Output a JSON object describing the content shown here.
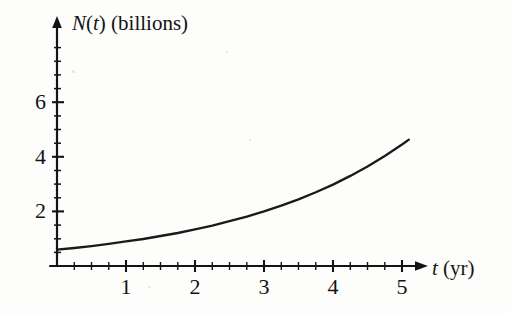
{
  "figure": {
    "background_color": "#fdfdfb",
    "ink_color": "#141414"
  },
  "axes": {
    "y_axis": {
      "label_prefix": "N",
      "label_variable": "(t)",
      "label_suffix": " (billions)",
      "full_label": "N(t) (billions)",
      "tick_labels": [
        "2",
        "4",
        "6"
      ],
      "tick_values": [
        2,
        4,
        6
      ],
      "minor_tick_step": 0.5,
      "has_arrow": true
    },
    "x_axis": {
      "label_variable": "t",
      "label_suffix": " (yr)",
      "full_label": "t (yr)",
      "tick_labels": [
        "1",
        "2",
        "3",
        "4",
        "5"
      ],
      "tick_values": [
        1,
        2,
        3,
        4,
        5
      ],
      "minor_tick_step": 0.25,
      "has_arrow": true
    }
  },
  "chart_data": {
    "type": "line",
    "title": "",
    "xlabel": "t (yr)",
    "ylabel": "N(t) (billions)",
    "xlim": [
      0,
      5.1
    ],
    "ylim": [
      0,
      8
    ],
    "grid": false,
    "legend": null,
    "series": [
      {
        "name": "N(t)",
        "description": "exponential population growth curve",
        "x": [
          0,
          0.25,
          0.5,
          0.75,
          1,
          1.25,
          1.5,
          1.75,
          2,
          2.25,
          2.5,
          2.75,
          3,
          3.25,
          3.5,
          3.75,
          4,
          4.25,
          4.5,
          4.75,
          5,
          5.1
        ],
        "y": [
          0.6,
          0.66,
          0.73,
          0.81,
          0.9,
          0.99,
          1.1,
          1.21,
          1.34,
          1.48,
          1.64,
          1.81,
          2.0,
          2.21,
          2.44,
          2.7,
          2.98,
          3.3,
          3.64,
          4.03,
          4.45,
          4.63
        ]
      }
    ],
    "read_off_values": {
      "t_0": 0.6,
      "t_1": 0.9,
      "t_2": 1.4,
      "t_3": 2.5,
      "t_4": 4.1,
      "t_5": 7.5
    },
    "curve_form": "exponential"
  }
}
